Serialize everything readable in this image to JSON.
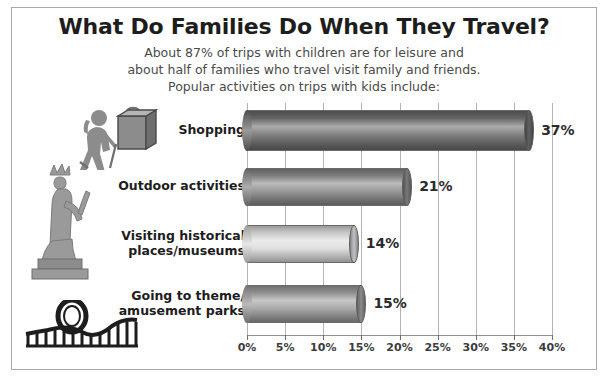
{
  "header": {
    "title": "What Do Families Do When They Travel?",
    "subtitle_line_1": "About 87% of trips with children are for leisure and",
    "subtitle_line_2": "about half of families who travel visit family and friends.",
    "subtitle_line_3": "Popular activities on trips with kids include:"
  },
  "icons": {
    "shopping_bag": "shopping-bag-icon",
    "hiker": "hiker-icon",
    "statue_of_liberty": "statue-of-liberty-icon",
    "roller_coaster": "roller-coaster-icon"
  },
  "colors": {
    "frame": "#a9a9a9",
    "gridline": "#b4b4b4",
    "bar_dark": "#6e6e6e",
    "bar_medium_dark": "#8a8a8a",
    "bar_light": "#dcdcdc",
    "bar_medium": "#9e9e9e",
    "text": "#1d1d1d",
    "subtitle_text": "#4a4a4a"
  },
  "chart_data": {
    "type": "bar",
    "orientation": "horizontal",
    "title": "What Do Families Do When They Travel?",
    "xlabel": "",
    "ylabel": "",
    "xlim": [
      0,
      40
    ],
    "grid": true,
    "legend": "none",
    "categories": [
      "Shopping",
      "Outdoor activities",
      "Visiting historical places/museums",
      "Going to theme/ amusement parks"
    ],
    "category_lines": [
      [
        "Shopping"
      ],
      [
        "Outdoor activities"
      ],
      [
        "Visiting historical",
        "places/museums"
      ],
      [
        "Going to theme/",
        "amusement parks"
      ]
    ],
    "values": [
      37,
      21,
      14,
      15
    ],
    "value_labels": [
      "37%",
      "21%",
      "14%",
      "15%"
    ],
    "bar_colors": [
      "#6e6e6e",
      "#8a8a8a",
      "#dcdcdc",
      "#9e9e9e"
    ],
    "tick_values": [
      0,
      5,
      10,
      15,
      20,
      25,
      30,
      35,
      40
    ],
    "tick_labels": [
      "0%",
      "5%",
      "10%",
      "15%",
      "20%",
      "25%",
      "30%",
      "35%",
      "40%"
    ]
  }
}
